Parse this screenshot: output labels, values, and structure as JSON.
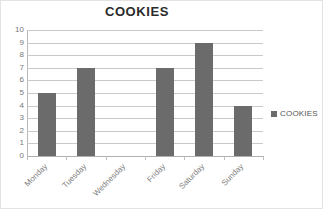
{
  "chart_data": {
    "type": "bar",
    "title": "COOKIES",
    "xlabel": "",
    "ylabel": "",
    "categories": [
      "Monday",
      "Tuesday",
      "Wednesday",
      "Friday",
      "Saturday",
      "Sunday"
    ],
    "values": [
      5,
      7,
      0,
      7,
      9,
      4
    ],
    "series": [
      {
        "name": "COOKIES",
        "values": [
          5,
          7,
          0,
          7,
          9,
          4
        ],
        "color": "#6b6b6b"
      }
    ],
    "ylim": [
      0,
      10
    ],
    "ytick_step": 1,
    "ytick_labels": [
      "10",
      "9",
      "8",
      "7",
      "6",
      "5",
      "4",
      "3",
      "2",
      "1",
      "0"
    ],
    "grid": true,
    "grid_axis": "y",
    "legend": {
      "position": "right",
      "entries": [
        {
          "label": "COOKIES",
          "color": "#6b6b6b"
        }
      ]
    },
    "xtick_label_rotation": -45,
    "colors": {
      "bar": "#6b6b6b",
      "gridline": "#c9c9c9",
      "axis": "#b8b8b8",
      "tick_text": "#777777",
      "category_text": "#808080",
      "title_text": "#2b2b2b",
      "border": "#e3e3e3",
      "background": "#ffffff"
    }
  }
}
